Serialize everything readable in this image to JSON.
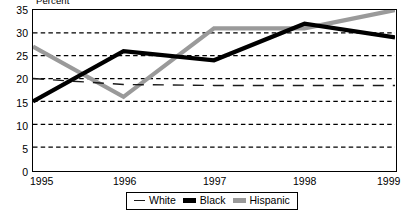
{
  "chart_data": {
    "type": "line",
    "title": "",
    "ylabel": "Percent",
    "xlabel": "",
    "categories": [
      "1995",
      "1996",
      "1997",
      "1998",
      "1999"
    ],
    "x": [
      1995,
      1996,
      1997,
      1998,
      1999
    ],
    "ylim": [
      0,
      35
    ],
    "xlim": [
      1995,
      1999
    ],
    "yticks": [
      0,
      5,
      10,
      15,
      20,
      25,
      30,
      35
    ],
    "ytick_labels": [
      "0",
      "5",
      "10",
      "15",
      "20",
      "25",
      "30",
      "35"
    ],
    "xtick_labels": [
      "1995",
      "1996",
      "1997",
      "1998",
      "1999"
    ],
    "grid": "horizontal-dashed",
    "legend_position": "bottom-center",
    "series": [
      {
        "name": "White",
        "values": [
          20,
          18.7,
          18.5,
          18.5,
          18.5
        ],
        "color": "#1a1a1a",
        "style": "dashed",
        "width": 1.4,
        "swatch": "sw-white"
      },
      {
        "name": "Black",
        "values": [
          15,
          26,
          24,
          32,
          29
        ],
        "color": "#000000",
        "style": "solid",
        "width": 4.2,
        "swatch": "sw-black"
      },
      {
        "name": "Hispanic",
        "values": [
          27,
          16,
          31,
          31,
          35
        ],
        "color": "#9a9a9a",
        "style": "solid",
        "width": 4.2,
        "swatch": "sw-hisp"
      }
    ]
  },
  "axis": {
    "y_title": "Percent",
    "y_labels": [
      "35",
      "30",
      "25",
      "20",
      "15",
      "10",
      "5",
      "0"
    ],
    "x_labels": [
      "1995",
      "1996",
      "1997",
      "1998",
      "1999"
    ]
  },
  "legend": {
    "items": [
      {
        "label": "White"
      },
      {
        "label": "Black"
      },
      {
        "label": "Hispanic"
      }
    ]
  },
  "colors": {
    "black_series": "#000000",
    "hispanic_series": "#9a9a9a",
    "white_series": "#1a1a1a",
    "grid": "#000000",
    "frame": "#000000"
  }
}
